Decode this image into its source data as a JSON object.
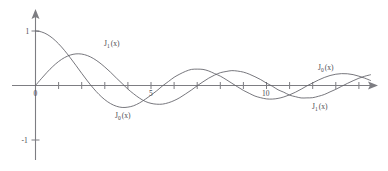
{
  "figure": {
    "name": "bessel-functions-plot",
    "background_color": "#ffffff",
    "axis_color": "#7d7d82",
    "curve_color": "#5f5f66",
    "text_color": "#4a4a50"
  },
  "chart_data": {
    "type": "line",
    "title": "",
    "subtitle": "",
    "xlabel": "",
    "ylabel": "",
    "xlim": [
      -0.4,
      14.8
    ],
    "ylim": [
      -1.55,
      1.35
    ],
    "grid": false,
    "legend_position": "inline-annotations",
    "x_ticks": [
      0,
      1,
      2,
      3,
      4,
      5,
      6,
      7,
      8,
      9,
      10,
      11,
      12,
      13,
      14
    ],
    "x_tick_labels": [
      {
        "value": 0,
        "label": "0"
      },
      {
        "value": 5,
        "label": "5"
      },
      {
        "value": 10,
        "label": "10"
      }
    ],
    "y_ticks": [
      1,
      -1
    ],
    "y_tick_labels": [
      {
        "value": 1,
        "label": "1"
      },
      {
        "value": -1,
        "label": "-1"
      }
    ],
    "x": [
      0,
      0.25,
      0.5,
      0.75,
      1,
      1.25,
      1.5,
      1.75,
      2,
      2.25,
      2.5,
      2.75,
      3,
      3.25,
      3.5,
      3.75,
      4,
      4.25,
      4.5,
      4.75,
      5,
      5.25,
      5.5,
      5.75,
      6,
      6.25,
      6.5,
      6.75,
      7,
      7.25,
      7.5,
      7.75,
      8,
      8.25,
      8.5,
      8.75,
      9,
      9.25,
      9.5,
      9.75,
      10,
      10.25,
      10.5,
      10.75,
      11,
      11.25,
      11.5,
      11.75,
      12,
      12.25,
      12.5,
      12.75,
      13,
      13.25,
      13.5,
      13.75,
      14,
      14.25,
      14.5
    ],
    "series": [
      {
        "name": "J_0(x)",
        "label": "J",
        "subscript": "0",
        "argument": "(x)",
        "values": [
          1.0,
          0.9844,
          0.9385,
          0.8642,
          0.7652,
          0.6459,
          0.5118,
          0.369,
          0.2239,
          0.0827,
          -0.0484,
          -0.1641,
          -0.2601,
          -0.3325,
          -0.3801,
          -0.4026,
          -0.3971,
          -0.371,
          -0.3205,
          -0.2526,
          -0.1776,
          -0.0968,
          -0.0068,
          0.0717,
          0.1506,
          0.2101,
          0.2601,
          0.2951,
          0.3001,
          0.2951,
          0.2663,
          0.2191,
          0.1717,
          0.1092,
          0.0419,
          -0.0251,
          -0.0903,
          -0.1431,
          -0.1939,
          -0.2243,
          -0.2459,
          -0.249,
          -0.2366,
          -0.2097,
          -0.1712,
          -0.1236,
          -0.0677,
          -0.0068,
          0.0477,
          0.1005,
          0.1469,
          0.183,
          0.2069,
          0.2176,
          0.215,
          0.1997,
          0.1711,
          0.1354,
          0.0925
        ]
      },
      {
        "name": "J_1(x)",
        "label": "J",
        "subscript": "1",
        "argument": "(x)",
        "values": [
          0.0,
          0.124,
          0.2423,
          0.3492,
          0.4401,
          0.5106,
          0.5579,
          0.5802,
          0.5767,
          0.5484,
          0.4971,
          0.4258,
          0.3391,
          0.2425,
          0.1374,
          0.0366,
          -0.066,
          -0.1529,
          -0.2311,
          -0.292,
          -0.3276,
          -0.3432,
          -0.3414,
          -0.317,
          -0.2767,
          -0.222,
          -0.1538,
          -0.0826,
          -0.0047,
          0.0671,
          0.1352,
          0.1906,
          0.2346,
          0.2567,
          0.2731,
          0.2644,
          0.2453,
          0.209,
          0.1613,
          0.1081,
          0.0435,
          -0.012,
          -0.0789,
          -0.1237,
          -0.1768,
          -0.2045,
          -0.2284,
          -0.2273,
          -0.2234,
          -0.1976,
          -0.1655,
          -0.1173,
          -0.0703,
          -0.0152,
          0.038,
          0.0879,
          0.1334,
          0.1698,
          0.1967
        ]
      }
    ],
    "annotations": [
      {
        "name": "label-j1-upper-left",
        "text_label": "J",
        "text_sub": "1",
        "text_arg": "(x)",
        "x_px": 104,
        "y_px": 46
      },
      {
        "name": "label-j0-lower-left",
        "text_label": "J",
        "text_sub": "0",
        "text_arg": "(x)",
        "x_px": 115,
        "y_px": 118
      },
      {
        "name": "label-j0-upper-right",
        "text_label": "J",
        "text_sub": "0",
        "text_arg": "(x)",
        "x_px": 318,
        "y_px": 70
      },
      {
        "name": "label-j1-lower-right",
        "text_label": "J",
        "text_sub": "1",
        "text_arg": "(x)",
        "x_px": 312,
        "y_px": 109
      }
    ]
  }
}
